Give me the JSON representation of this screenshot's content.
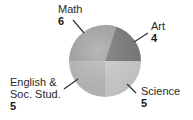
{
  "chart_data": {
    "type": "pie",
    "title": "",
    "categories": [
      "Math",
      "Art",
      "Science",
      "English & Soc. Stud."
    ],
    "values": [
      6,
      4,
      5,
      5
    ],
    "colors": [
      "#a9a9a9",
      "#7d7d7d",
      "#d0d0d0",
      "#bdbdbd"
    ],
    "legend": "none (direct labels with leader lines)",
    "labels": [
      {
        "name": "Math",
        "value": "6"
      },
      {
        "name": "Art",
        "value": "4"
      },
      {
        "name": "Science",
        "value": "5"
      },
      {
        "name_line1": "English &",
        "name_line2": "Soc. Stud.",
        "value": "5"
      }
    ]
  }
}
